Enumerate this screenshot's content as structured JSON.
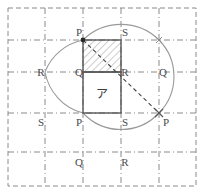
{
  "figure": {
    "canvas": {
      "width": 203,
      "height": 194,
      "background": "#ffffff"
    },
    "colors": {
      "grid": "#8a8a8a",
      "outer_border": "#8a8a8a",
      "arc": "#9a9a9a",
      "square_stroke": "#555555",
      "diagonal": "#444444",
      "hatch": "#8e8e8e",
      "label_text": "#4a4a4a",
      "marker": "#2b2b2b"
    },
    "grid": {
      "style": "dash-dot",
      "x_lines": [
        8,
        45,
        83,
        121,
        159,
        196
      ],
      "y_lines": [
        8,
        40,
        72,
        110,
        152,
        186
      ],
      "cell_width": 38,
      "cell_height": 36
    },
    "squares": {
      "hatched": {
        "name": "PSRQ-hatched",
        "x": 83,
        "y": 40,
        "width": 38,
        "height": 32,
        "fill": "hatch-diagonal"
      },
      "plain": {
        "name": "region-a",
        "x": 83,
        "y": 72,
        "width": 38,
        "height": 41,
        "fill": "none"
      }
    },
    "diagonal": {
      "from": {
        "x": 83,
        "y": 40
      },
      "to": {
        "x": 159,
        "y": 113
      },
      "style": "dashed"
    },
    "markers": [
      {
        "label": "P-start",
        "x": 83,
        "y": 40
      },
      {
        "label": "P-end",
        "x": 159,
        "y": 113
      }
    ],
    "arcs": [
      {
        "name": "arc-top-right",
        "d": "M 83 40 A 54 54 0 0 1 159 40"
      },
      {
        "name": "arc-right-lower",
        "d": "M 159 40 A 54 54 0 0 1 159 113"
      },
      {
        "name": "arc-left-upper",
        "d": "M 83 40 A 52 52 0 0 0 45 72"
      },
      {
        "name": "arc-left-lower",
        "d": "M 45 72 A 52 52 0 0 0 83 113"
      },
      {
        "name": "arc-bottom",
        "d": "M 83 113 A 52 52 0 0 0 159 113"
      }
    ],
    "labels": [
      {
        "id": "label-p-top",
        "text": "P",
        "x": 79,
        "y": 36
      },
      {
        "id": "label-s-top",
        "text": "S",
        "x": 125,
        "y": 36
      },
      {
        "id": "label-r-left",
        "text": "R",
        "x": 41,
        "y": 76
      },
      {
        "id": "label-q-inner-left",
        "text": "Q",
        "x": 79,
        "y": 76
      },
      {
        "id": "label-r-inner",
        "text": "R",
        "x": 125,
        "y": 76
      },
      {
        "id": "label-q-right",
        "text": "Q",
        "x": 163,
        "y": 76
      },
      {
        "id": "label-s-left",
        "text": "S",
        "x": 41,
        "y": 126
      },
      {
        "id": "label-p-bottom-left",
        "text": "P",
        "x": 79,
        "y": 126
      },
      {
        "id": "label-s-bottom",
        "text": "S",
        "x": 125,
        "y": 126
      },
      {
        "id": "label-p-right",
        "text": "P",
        "x": 166,
        "y": 126
      },
      {
        "id": "label-q-bottom",
        "text": "Q",
        "x": 79,
        "y": 166
      },
      {
        "id": "label-r-bottom",
        "text": "R",
        "x": 125,
        "y": 166
      }
    ],
    "region_marker": {
      "id": "region-label-a",
      "text": "ア",
      "x": 102,
      "y": 94
    }
  }
}
